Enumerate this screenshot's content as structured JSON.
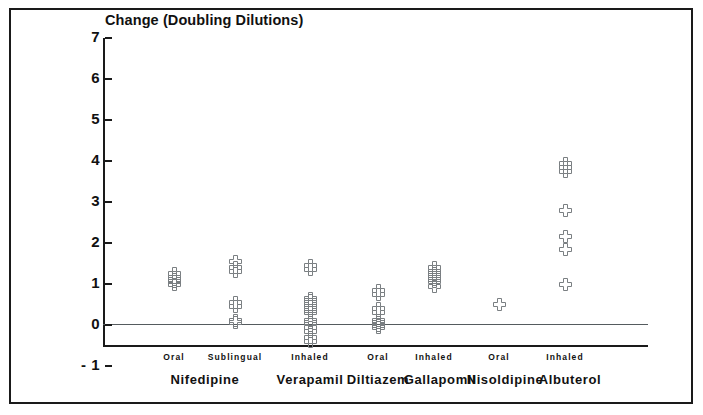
{
  "chart_data": {
    "type": "scatter",
    "title": "",
    "xlabel": "",
    "ylabel": "Change (Doubling Dilutions)",
    "ylim": [
      -1,
      7
    ],
    "yticks": [
      7,
      6,
      5,
      4,
      3,
      2,
      1,
      0,
      -1
    ],
    "ytick_labels": [
      "7",
      "6",
      "5",
      "4",
      "3",
      "2",
      "1",
      "0",
      "- 1"
    ],
    "grid": false,
    "legend": "none",
    "zero_reference_line": 0,
    "marker_style": "open-cross",
    "marker_color": "#7a7f82",
    "categories": [
      "Oral",
      "Sublingual",
      "Inhaled",
      "Oral",
      "Inhaled",
      "Oral",
      "Inhaled"
    ],
    "groups": [
      {
        "drug": "Nifedipine",
        "route": "Oral",
        "x": 174,
        "values": [
          1.25,
          1.15,
          1.12,
          1.05,
          1.0
        ]
      },
      {
        "drug": "Nifedipine",
        "route": "Sublingual",
        "x": 235,
        "values": [
          1.55,
          1.4,
          1.3,
          0.55,
          0.45,
          0.1,
          0.05
        ]
      },
      {
        "drug": "Verapamil",
        "route": "Inhaled",
        "x": 310,
        "values": [
          1.45,
          1.35,
          0.65,
          0.6,
          0.5,
          0.45,
          0.35,
          0.3,
          0.1,
          0.05,
          -0.05,
          -0.15,
          -0.3,
          -0.4
        ]
      },
      {
        "drug": "Diltiazem",
        "route": "Oral",
        "x": 378,
        "values": [
          0.85,
          0.75,
          0.4,
          0.3,
          0.1,
          0.05,
          0.0,
          -0.05
        ]
      },
      {
        "drug": "Gallapomil",
        "route": "Inhaled",
        "x": 434,
        "values": [
          1.4,
          1.3,
          1.25,
          1.2,
          1.15,
          1.1,
          1.05,
          0.95
        ]
      },
      {
        "drug": "Nisoldipine",
        "route": "Oral",
        "x": 499,
        "values": [
          0.5
        ]
      },
      {
        "drug": "Albuterol",
        "route": "Inhaled",
        "x": 565,
        "values": [
          3.95,
          3.85,
          3.75,
          2.8,
          2.15,
          1.85,
          1.0
        ]
      }
    ],
    "drug_label_positions": [
      {
        "drug": "Nifedipine",
        "x": 205
      },
      {
        "drug": "Verapamil",
        "x": 310
      },
      {
        "drug": "Diltiazem",
        "x": 378
      },
      {
        "drug": "Gallapomil",
        "x": 440
      },
      {
        "drug": "Nisoldipine",
        "x": 505
      },
      {
        "drug": "Albuterol",
        "x": 570
      }
    ]
  }
}
